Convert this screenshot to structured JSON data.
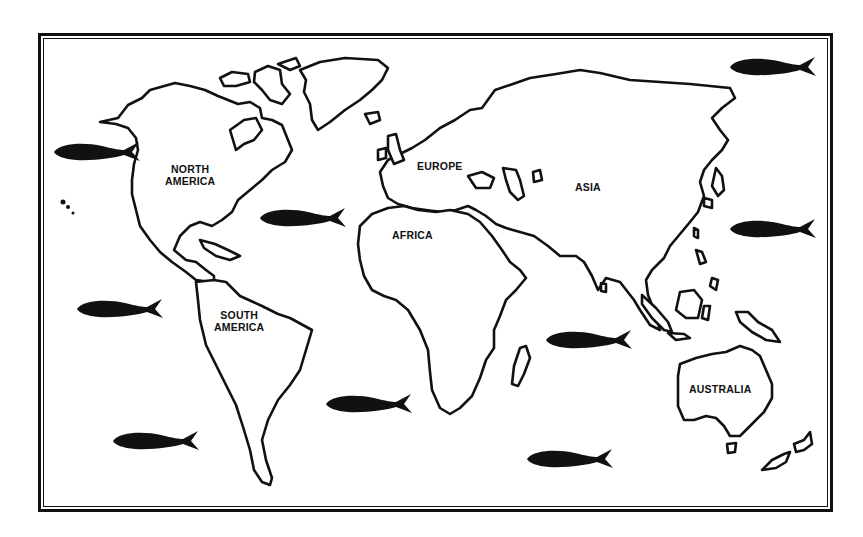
{
  "map": {
    "title": "",
    "style": {
      "ink": "#111111",
      "paper": "#ffffff"
    },
    "labels": [
      {
        "id": "north-america",
        "text": "NORTH\nAMERICA",
        "x": 165,
        "y": 163
      },
      {
        "id": "europe",
        "text": "EUROPE",
        "x": 417,
        "y": 160
      },
      {
        "id": "asia",
        "text": "ASIA",
        "x": 575,
        "y": 181
      },
      {
        "id": "africa",
        "text": "AFRICA",
        "x": 392,
        "y": 229
      },
      {
        "id": "south-america",
        "text": "SOUTH\nAMERICA",
        "x": 214,
        "y": 309
      },
      {
        "id": "australia",
        "text": "AUSTRALIA",
        "x": 689,
        "y": 383
      }
    ],
    "fish": [
      {
        "id": "fish-1",
        "ocean": "north-pacific-east",
        "cx": 97,
        "cy": 152
      },
      {
        "id": "fish-2",
        "ocean": "north-atlantic",
        "cx": 303,
        "cy": 218
      },
      {
        "id": "fish-3",
        "ocean": "north-pacific-west",
        "cx": 773,
        "cy": 67
      },
      {
        "id": "fish-4",
        "ocean": "west-pacific",
        "cx": 773,
        "cy": 229
      },
      {
        "id": "fish-5",
        "ocean": "south-pacific-east",
        "cx": 120,
        "cy": 309
      },
      {
        "id": "fish-6",
        "ocean": "indian-ocean",
        "cx": 589,
        "cy": 340
      },
      {
        "id": "fish-7",
        "ocean": "south-atlantic",
        "cx": 369,
        "cy": 404
      },
      {
        "id": "fish-8",
        "ocean": "south-pacific",
        "cx": 156,
        "cy": 441
      },
      {
        "id": "fish-9",
        "ocean": "southern-indian-ocean",
        "cx": 570,
        "cy": 459
      }
    ]
  }
}
